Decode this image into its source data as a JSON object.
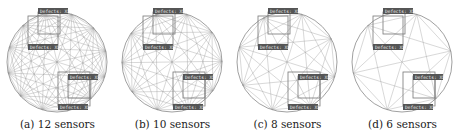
{
  "panels": [
    {
      "caption": "(a) 12 sensors",
      "sensors": 12,
      "label_text": "Defects: XX"
    },
    {
      "caption": "(b) 10 sensors",
      "sensors": 10,
      "label_text": "Defects: XX"
    },
    {
      "caption": "(c) 8 sensors",
      "sensors": 8,
      "label_text": "Defects: XX"
    },
    {
      "caption": "(d) 6 sensors",
      "sensors": 6,
      "label_text": "Defects: XX"
    }
  ],
  "colors": {
    "line": "#999999",
    "circle": "#888888",
    "box": "#777777",
    "label_bg": "#555555",
    "label_fg": "#eeeeee"
  }
}
